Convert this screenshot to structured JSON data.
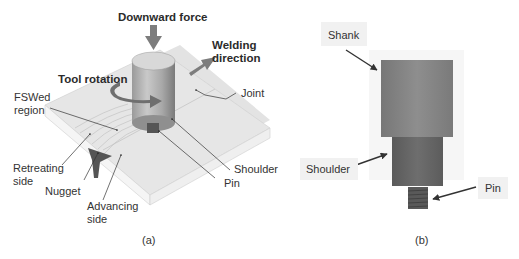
{
  "panel_a": {
    "caption": "(a)",
    "labels": {
      "downward_force": "Downward force",
      "welding_direction": "Welding\ndirection",
      "tool_rotation": "Tool rotation",
      "joint": "Joint",
      "fswed_region": "FSWed\nregion",
      "retreating_side": "Retreating\nside",
      "nugget": "Nugget",
      "advancing_side": "Advancing\nside",
      "shoulder": "Shoulder",
      "pin": "Pin"
    }
  },
  "panel_b": {
    "caption": "(b)",
    "labels": {
      "shank": "Shank",
      "shoulder": "Shoulder",
      "pin": "Pin"
    }
  },
  "colors": {
    "plate_top": "#e2e2e2",
    "plate_side": "#f4f4f4",
    "tool": "#8a8a8a",
    "tool_dark": "#5c5c5c",
    "arrow": "#808080"
  }
}
